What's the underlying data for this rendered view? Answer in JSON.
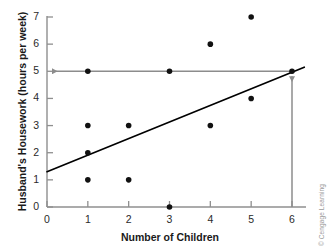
{
  "chart_data": {
    "type": "scatter",
    "title": "",
    "xlabel": "Number of Children",
    "ylabel": "Husband's Housework (hours per week)",
    "xlim": [
      0,
      6.35
    ],
    "ylim": [
      0,
      7.3
    ],
    "xticks": [
      0,
      1,
      2,
      3,
      4,
      5,
      6
    ],
    "xtick_labels": [
      "0",
      "1",
      "2",
      "3",
      "4",
      "5",
      "6"
    ],
    "yticks": [
      0,
      1,
      2,
      3,
      4,
      5,
      6,
      7
    ],
    "ytick_labels": [
      "0",
      "1",
      "2",
      "3",
      "4",
      "5",
      "6",
      "7"
    ],
    "grid": false,
    "legend": null,
    "points": [
      {
        "x": 1,
        "y": 5
      },
      {
        "x": 1,
        "y": 3
      },
      {
        "x": 1,
        "y": 2
      },
      {
        "x": 1,
        "y": 1
      },
      {
        "x": 2,
        "y": 3
      },
      {
        "x": 2,
        "y": 1
      },
      {
        "x": 3,
        "y": 5
      },
      {
        "x": 3,
        "y": 0
      },
      {
        "x": 4,
        "y": 6
      },
      {
        "x": 4,
        "y": 3
      },
      {
        "x": 5,
        "y": 7
      },
      {
        "x": 5,
        "y": 4
      },
      {
        "x": 6,
        "y": 5
      }
    ],
    "regression_line": {
      "label": "regression line",
      "x_start": 0,
      "y_start": 1.3,
      "x_end": 6.3,
      "y_end": 5.15,
      "color": "#000000"
    },
    "annotations": [
      {
        "name": "prediction-horizontal-guide",
        "kind": "arrow",
        "description": "horizontal guide at y = 5 pointing left to the y-axis",
        "y": 5,
        "x_from": 6,
        "x_to": 0,
        "color": "#8c8c8c"
      },
      {
        "name": "prediction-vertical-guide",
        "kind": "arrow",
        "description": "vertical guide at x = 6 pointing up to the regression line",
        "x": 6,
        "y_from": 0,
        "y_to": 5,
        "color": "#8c8c8c"
      }
    ],
    "marker": {
      "shape": "circle",
      "color": "#111111",
      "size_px": 5.6
    },
    "axis_color": "#8f8f8f"
  },
  "credit": {
    "text": "© Cengage Learning"
  }
}
